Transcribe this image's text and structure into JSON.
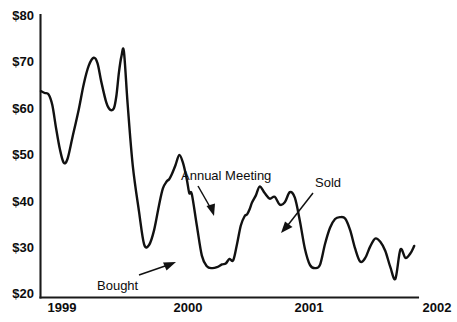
{
  "chart_data": {
    "type": "line",
    "title": "",
    "subtitle": "",
    "xlabel": "",
    "ylabel": "",
    "xlim": [
      1999.0,
      2002.0
    ],
    "ylim": [
      20,
      80
    ],
    "grid": false,
    "legend": "none",
    "y_tick_labels": [
      "$80",
      "$70",
      "$60",
      "$50",
      "$40",
      "$30",
      "$20"
    ],
    "y_tick_values": [
      80,
      70,
      60,
      50,
      40,
      30,
      20
    ],
    "x_tick_labels": [
      "1999",
      "2000",
      "2001",
      "2002"
    ],
    "x_tick_values": [
      1999,
      2000,
      2001,
      2002
    ],
    "series": [
      {
        "name": "Share price",
        "units": "USD",
        "x": [
          1999.0,
          1999.03,
          1999.06,
          1999.09,
          1999.12,
          1999.15,
          1999.18,
          1999.21,
          1999.25,
          1999.3,
          1999.34,
          1999.38,
          1999.42,
          1999.45,
          1999.48,
          1999.52,
          1999.55,
          1999.58,
          1999.6,
          1999.62,
          1999.64,
          1999.66,
          1999.69,
          1999.73,
          1999.78,
          1999.82,
          1999.86,
          1999.9,
          1999.94,
          1999.97,
          2000.0,
          2000.02,
          2000.04,
          2000.07,
          2000.1,
          2000.13,
          2000.16,
          2000.18,
          2000.2,
          2000.24,
          2000.28,
          2000.32,
          2000.36,
          2000.4,
          2000.44,
          2000.47,
          2000.5,
          2000.53,
          2000.56,
          2000.59,
          2000.62,
          2000.64,
          2000.66,
          2000.68,
          2000.71,
          2000.74,
          2000.78,
          2000.82,
          2000.86,
          2000.9,
          2000.94,
          2000.98,
          2001.02,
          2001.06,
          2001.1,
          2001.14,
          2001.18,
          2001.22,
          2001.26,
          2001.3,
          2001.34,
          2001.38,
          2001.42,
          2001.46,
          2001.5,
          2001.54,
          2001.58,
          2001.62,
          2001.66,
          2001.7,
          2001.74,
          2001.78,
          2001.82,
          2001.86,
          2001.9,
          2001.94,
          2001.97
        ],
        "y": [
          64.0,
          63.6,
          63.3,
          61.0,
          56.0,
          51.5,
          48.6,
          49.3,
          54.0,
          60.0,
          65.5,
          69.5,
          71.2,
          70.0,
          66.0,
          61.5,
          60.0,
          60.3,
          63.0,
          68.0,
          71.5,
          72.5,
          61.0,
          48.0,
          38.0,
          31.0,
          30.8,
          34.0,
          39.5,
          43.0,
          44.5,
          45.0,
          46.0,
          48.0,
          50.2,
          48.5,
          45.0,
          42.0,
          41.8,
          35.0,
          28.5,
          26.2,
          25.8,
          26.0,
          26.6,
          26.8,
          27.8,
          27.5,
          31.0,
          35.0,
          37.0,
          37.4,
          38.5,
          40.0,
          41.5,
          43.4,
          42.0,
          40.8,
          41.2,
          39.5,
          40.0,
          42.2,
          41.0,
          36.0,
          30.0,
          26.5,
          25.8,
          26.5,
          31.0,
          34.5,
          36.4,
          36.8,
          36.5,
          34.0,
          30.0,
          27.2,
          28.0,
          30.5,
          32.2,
          31.5,
          29.5,
          26.0,
          23.5,
          29.8,
          28.0,
          29.0,
          30.6
        ]
      }
    ],
    "annotations": [
      {
        "id": "bought",
        "label": "Bought",
        "note": "arrow points up-right to the trough near early 2000",
        "target_x": 2000.33,
        "target_y": 26.3
      },
      {
        "id": "annual-meeting",
        "label": "Annual Meeting",
        "note": "arrow points down to the rising leg in mid 2000",
        "target_x": 2000.6,
        "target_y": 35.0
      },
      {
        "id": "sold",
        "label": "Sold",
        "note": "arrow points down-left to the sharp drop in early 2001",
        "target_x": 2001.08,
        "target_y": 33.5
      }
    ]
  },
  "axis": {
    "y_labels": [
      "$80",
      "$70",
      "$60",
      "$50",
      "$40",
      "$30",
      "$20"
    ],
    "x_labels": [
      "1999",
      "2000",
      "2001",
      "2002"
    ]
  },
  "annotations": {
    "bought": "Bought",
    "annual_meeting": "Annual Meeting",
    "sold": "Sold"
  },
  "colors": {
    "line": "#111111",
    "axis": "#1a1a1a",
    "text": "#0d0d0d",
    "background": "#ffffff"
  }
}
